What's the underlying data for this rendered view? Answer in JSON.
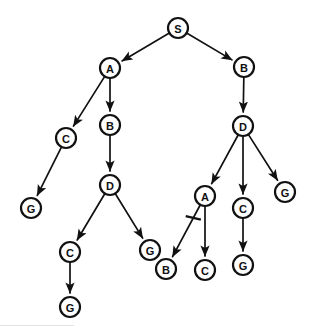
{
  "diagram": {
    "type": "directed-tree",
    "background_color": "#ffffff",
    "stroke_color": "#111111",
    "node_fill_color": "#ffffff",
    "node_radius": 10,
    "canvas": {
      "width": 313,
      "height": 329
    },
    "nodes": [
      {
        "id": "n0",
        "label": "S",
        "x": 178,
        "y": 28
      },
      {
        "id": "n1",
        "label": "A",
        "x": 110,
        "y": 68
      },
      {
        "id": "n2",
        "label": "B",
        "x": 244,
        "y": 67
      },
      {
        "id": "n3",
        "label": "C",
        "x": 66,
        "y": 138
      },
      {
        "id": "n4",
        "label": "B",
        "x": 110,
        "y": 125
      },
      {
        "id": "n5",
        "label": "D",
        "x": 243,
        "y": 126
      },
      {
        "id": "n6",
        "label": "G",
        "x": 31,
        "y": 208
      },
      {
        "id": "n7",
        "label": "D",
        "x": 110,
        "y": 185
      },
      {
        "id": "n8",
        "label": "A",
        "x": 205,
        "y": 196
      },
      {
        "id": "n9",
        "label": "C",
        "x": 243,
        "y": 208
      },
      {
        "id": "n10",
        "label": "G",
        "x": 285,
        "y": 192
      },
      {
        "id": "n11",
        "label": "C",
        "x": 70,
        "y": 252
      },
      {
        "id": "n12",
        "label": "G",
        "x": 150,
        "y": 250
      },
      {
        "id": "n13",
        "label": "B",
        "x": 166,
        "y": 269
      },
      {
        "id": "n14",
        "label": "C",
        "x": 205,
        "y": 270
      },
      {
        "id": "n15",
        "label": "G",
        "x": 243,
        "y": 265
      },
      {
        "id": "n16",
        "label": "G",
        "x": 70,
        "y": 307
      }
    ],
    "edges": [
      {
        "from": "n0",
        "to": "n1",
        "cut": false
      },
      {
        "from": "n0",
        "to": "n2",
        "cut": false
      },
      {
        "from": "n1",
        "to": "n3",
        "cut": false
      },
      {
        "from": "n1",
        "to": "n4",
        "cut": false
      },
      {
        "from": "n2",
        "to": "n5",
        "cut": false
      },
      {
        "from": "n3",
        "to": "n6",
        "cut": false
      },
      {
        "from": "n4",
        "to": "n7",
        "cut": false
      },
      {
        "from": "n5",
        "to": "n8",
        "cut": false
      },
      {
        "from": "n5",
        "to": "n9",
        "cut": false
      },
      {
        "from": "n5",
        "to": "n10",
        "cut": false
      },
      {
        "from": "n7",
        "to": "n11",
        "cut": false
      },
      {
        "from": "n7",
        "to": "n12",
        "cut": false
      },
      {
        "from": "n8",
        "to": "n13",
        "cut": true
      },
      {
        "from": "n8",
        "to": "n14",
        "cut": false
      },
      {
        "from": "n9",
        "to": "n15",
        "cut": false
      },
      {
        "from": "n11",
        "to": "n16",
        "cut": false
      }
    ]
  }
}
